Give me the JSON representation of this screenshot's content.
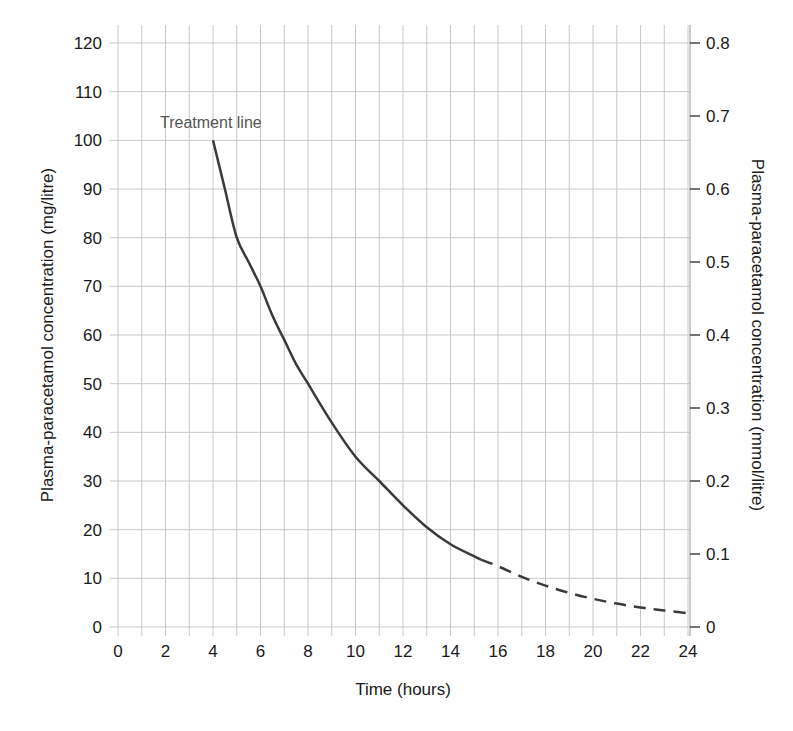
{
  "chart_data": {
    "type": "line",
    "title": "",
    "xlabel": "Time (hours)",
    "ylabel": "Plasma-paracetamol concentration (mg/litre)",
    "ylabel_right": "Plasma-paracetamol concentration (mmol/litre)",
    "xlim": [
      0,
      24
    ],
    "ylim": [
      0,
      120
    ],
    "ylim_right": [
      0,
      0.8
    ],
    "x_ticks": [
      0,
      2,
      4,
      6,
      8,
      10,
      12,
      14,
      16,
      18,
      20,
      22,
      24
    ],
    "y_ticks": [
      0,
      10,
      20,
      30,
      40,
      50,
      60,
      70,
      80,
      90,
      100,
      110,
      120
    ],
    "y_ticks_right": [
      "0",
      "0.1",
      "0.2",
      "0.3",
      "0.4",
      "0.5",
      "0.6",
      "0.7",
      "0.8"
    ],
    "grid": true,
    "grid_x_step": 1,
    "grid_y_step": 10,
    "annotations": [
      {
        "text": "Treatment line",
        "x": 4,
        "y": 103
      }
    ],
    "series": [
      {
        "name": "Treatment line",
        "style": "solid",
        "x": [
          4,
          4.5,
          5,
          5.5,
          6,
          6.5,
          7,
          7.5,
          8,
          9,
          10,
          11,
          12,
          13,
          14,
          15,
          15.3
        ],
        "values": [
          100,
          90,
          80,
          75,
          70,
          64,
          59,
          54,
          50,
          42,
          35,
          30,
          25,
          20.5,
          17,
          14.5,
          13.8
        ]
      },
      {
        "name": "Treatment line (extrapolated)",
        "style": "dashed",
        "x": [
          15.3,
          16,
          17,
          18,
          19,
          20,
          21,
          22,
          23,
          24
        ],
        "values": [
          13.8,
          12.5,
          10.3,
          8.5,
          7.0,
          5.8,
          4.8,
          4.0,
          3.4,
          2.8
        ]
      }
    ]
  },
  "colors": {
    "grid": "#c8c8c8",
    "axis": "#9a9a9a",
    "curve": "#3a3a3a",
    "text": "#1a1a1a",
    "annotation": "#555555"
  }
}
